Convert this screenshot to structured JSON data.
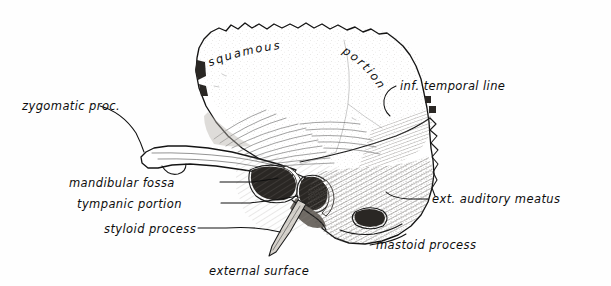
{
  "figure": {
    "caption": "external surface",
    "style": "engraved line drawing with hand-lettered labels",
    "background_color": "#fefefe",
    "ink_color": "#141414"
  },
  "labels": {
    "squamous": "squamous",
    "portion": "portion",
    "inf_temporal_line": "inf. temporal line",
    "zygomatic_proc": "zygomatic proc.",
    "mandibular_fossa": "mandibular fossa",
    "tympanic_portion": "tympanic portion",
    "styloid_process": "styloid process",
    "ext_auditory_meatus": "ext. auditory meatus",
    "mastoid_process": "mastoid process",
    "external_surface": "external surface"
  }
}
